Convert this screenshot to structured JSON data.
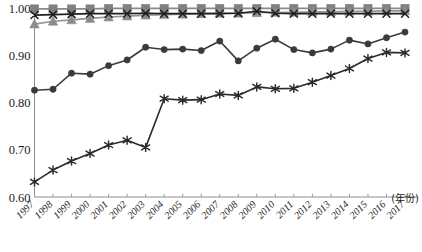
{
  "chart_data": {
    "type": "line",
    "title": "",
    "subtitle": "",
    "xlabel": "(年份)",
    "ylabel": "",
    "xlim": [
      1997,
      2017
    ],
    "ylim": [
      0.6,
      1.0
    ],
    "grid": false,
    "legend_position": "none",
    "ytick_labels": [
      "1.00",
      "0.90",
      "0.80",
      "0.70",
      "0.60"
    ],
    "ytick_values": [
      1.0,
      0.9,
      0.8,
      0.7,
      0.6
    ],
    "categories": [
      "1997",
      "1998",
      "1999",
      "2000",
      "2001",
      "2002",
      "2003",
      "2004",
      "2005",
      "2006",
      "2007",
      "2008",
      "2009",
      "2010",
      "2011",
      "2012",
      "2013",
      "2014",
      "2015",
      "2016",
      "2017"
    ],
    "x": [
      1997,
      1998,
      1999,
      2000,
      2001,
      2002,
      2003,
      2004,
      2005,
      2006,
      2007,
      2008,
      2009,
      2010,
      2011,
      2012,
      2013,
      2014,
      2015,
      2016,
      2017
    ],
    "series": [
      {
        "name": "series-squares",
        "marker": "square",
        "color": "#808080",
        "line_color": "#8a8a8a",
        "values": [
          0.998,
          0.998,
          0.998,
          0.998,
          0.999,
          0.999,
          0.999,
          0.999,
          0.999,
          0.999,
          0.999,
          0.999,
          0.999,
          0.999,
          0.999,
          0.999,
          0.999,
          0.999,
          0.999,
          0.999,
          0.999
        ]
      },
      {
        "name": "series-triangles",
        "marker": "triangle",
        "color": "#8c8c8c",
        "line_color": "#949494",
        "values": [
          0.966,
          0.972,
          0.975,
          0.978,
          0.981,
          0.983,
          0.985,
          0.986,
          0.987,
          0.988,
          0.989,
          0.989,
          0.99,
          0.991,
          0.991,
          0.992,
          0.992,
          0.993,
          0.993,
          0.994,
          0.994
        ]
      },
      {
        "name": "series-crosses",
        "marker": "x",
        "color": "#1f1f1f",
        "line_color": "#1f1f1f",
        "values": [
          0.985,
          0.986,
          0.987,
          0.988,
          0.988,
          0.988,
          0.989,
          0.988,
          0.988,
          0.988,
          0.988,
          0.989,
          0.993,
          0.989,
          0.988,
          0.988,
          0.988,
          0.988,
          0.988,
          0.988,
          0.988
        ]
      },
      {
        "name": "series-circles",
        "marker": "circle",
        "color": "#3a3a3a",
        "line_color": "#3a3a3a",
        "values": [
          0.826,
          0.828,
          0.862,
          0.86,
          0.878,
          0.89,
          0.917,
          0.912,
          0.913,
          0.91,
          0.93,
          0.888,
          0.915,
          0.934,
          0.912,
          0.905,
          0.913,
          0.932,
          0.924,
          0.937,
          0.949
        ]
      },
      {
        "name": "series-asterisks",
        "marker": "asterisk",
        "color": "#2b2b2b",
        "line_color": "#2b2b2b",
        "values": [
          0.632,
          0.657,
          0.676,
          0.692,
          0.71,
          0.72,
          0.705,
          0.808,
          0.805,
          0.806,
          0.818,
          0.815,
          0.833,
          0.829,
          0.83,
          0.843,
          0.857,
          0.872,
          0.893,
          0.906,
          0.905
        ]
      }
    ]
  },
  "axis": {
    "x_unit_label": "(年份)"
  }
}
